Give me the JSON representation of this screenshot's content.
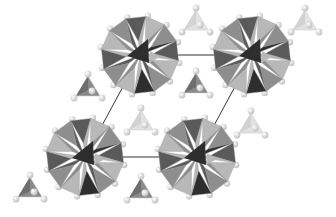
{
  "figure": {
    "background": "#ffffff",
    "unit_cell": {
      "corners": [
        [
          140,
          55
        ],
        [
          252,
          55
        ],
        [
          197,
          157
        ],
        [
          85,
          157
        ]
      ],
      "line_color": "#333333"
    },
    "clusters": [
      {
        "id": "cluster-top-left",
        "cx": 140,
        "cy": 55,
        "r": 39
      },
      {
        "id": "cluster-top-right",
        "cx": 252,
        "cy": 55,
        "r": 39
      },
      {
        "id": "cluster-bottom-left",
        "cx": 85,
        "cy": 157,
        "r": 39
      },
      {
        "id": "cluster-bottom-right",
        "cx": 197,
        "cy": 157,
        "r": 39
      }
    ],
    "tetrahedra": [
      {
        "id": "tetra-1",
        "cx": 88,
        "cy": 88,
        "shade": "dark"
      },
      {
        "id": "tetra-2",
        "cx": 196,
        "cy": 85,
        "shade": "dark"
      },
      {
        "id": "tetra-3",
        "cx": 141,
        "cy": 122,
        "shade": "light"
      },
      {
        "id": "tetra-4",
        "cx": 251,
        "cy": 125,
        "shade": "light"
      },
      {
        "id": "tetra-5",
        "cx": 30,
        "cy": 189,
        "shade": "dark"
      },
      {
        "id": "tetra-6",
        "cx": 141,
        "cy": 190,
        "shade": "dark"
      },
      {
        "id": "tetra-7",
        "cx": 196,
        "cy": 22,
        "shade": "light"
      },
      {
        "id": "tetra-8",
        "cx": 305,
        "cy": 22,
        "shade": "light"
      }
    ],
    "colors": {
      "face_light": "#b8b8b8",
      "face_mid": "#8e8e8e",
      "face_dark": "#5a5a5a",
      "face_darkest": "#2e2e2e",
      "atom": "#e6e6e6",
      "tetra_dark": "#8a8a8a",
      "tetra_light": "#e2e2e2"
    }
  }
}
